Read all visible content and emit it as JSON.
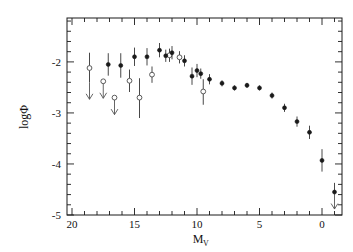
{
  "figure": {
    "background_color": "#ffffff",
    "axis_color": "#1a1a1a",
    "marker_filled_color": "#1a1a1a",
    "marker_open_color": "#ffffff",
    "arrow_color": "#555555"
  },
  "axes": {
    "x_label_main": "M",
    "x_label_sub": "V",
    "y_label": "logΦ",
    "x_ticklabels": [
      "20",
      "15",
      "10",
      "5",
      "0"
    ],
    "y_ticklabels": [
      "-2",
      "-3",
      "-4",
      "-5"
    ]
  },
  "chart_data": {
    "type": "scatter",
    "title": "",
    "xlabel": "M_V",
    "ylabel": "logΦ",
    "xlim": [
      20.4,
      -1.6
    ],
    "ylim": [
      -5.0,
      -1.14
    ],
    "x_major_ticks": [
      20,
      15,
      10,
      5,
      0
    ],
    "x_minor_tick_step": 1,
    "y_major_ticks": [
      -2,
      -3,
      -4,
      -5
    ],
    "y_minor_tick_step": 0.2,
    "grid": false,
    "legend": null,
    "x_axis_inverted": true,
    "series": [
      {
        "name": "Open symbols (upper limits and uncertain bins)",
        "marker": "open-circle",
        "points": [
          {
            "x": 18.6,
            "y": -2.12,
            "yerr_low": 0.28,
            "yerr_high": 0.3,
            "upper_limit": true
          },
          {
            "x": 17.5,
            "y": -2.38,
            "yerr_low": 0.0,
            "yerr_high": 0.0,
            "upper_limit": true
          },
          {
            "x": 16.6,
            "y": -2.7,
            "yerr_low": 0.0,
            "yerr_high": 0.0,
            "upper_limit": true
          },
          {
            "x": 14.6,
            "y": -2.7,
            "yerr_low": 0.4,
            "yerr_high": 0.38,
            "upper_limit": false
          },
          {
            "x": 15.4,
            "y": -2.37,
            "yerr_low": 0.22,
            "yerr_high": 0.22,
            "upper_limit": false
          },
          {
            "x": 13.6,
            "y": -2.25,
            "yerr_low": 0.16,
            "yerr_high": 0.16,
            "upper_limit": false
          },
          {
            "x": 12.2,
            "y": -1.87,
            "yerr_low": 0.13,
            "yerr_high": 0.13,
            "upper_limit": false
          },
          {
            "x": 11.4,
            "y": -1.91,
            "yerr_low": 0.12,
            "yerr_high": 0.12,
            "upper_limit": false
          },
          {
            "x": 9.5,
            "y": -2.58,
            "yerr_low": 0.26,
            "yerr_high": 0.24,
            "upper_limit": false
          }
        ]
      },
      {
        "name": "Filled symbols (measured luminosity function)",
        "marker": "filled-circle",
        "points": [
          {
            "x": 17.1,
            "y": -2.05,
            "yerr_low": 0.22,
            "yerr_high": 0.22,
            "upper_limit": false
          },
          {
            "x": 16.1,
            "y": -2.07,
            "yerr_low": 0.24,
            "yerr_high": 0.24,
            "upper_limit": false
          },
          {
            "x": 15.0,
            "y": -1.9,
            "yerr_low": 0.18,
            "yerr_high": 0.18,
            "upper_limit": false
          },
          {
            "x": 14.0,
            "y": -1.9,
            "yerr_low": 0.17,
            "yerr_high": 0.17,
            "upper_limit": false
          },
          {
            "x": 13.0,
            "y": -1.77,
            "yerr_low": 0.14,
            "yerr_high": 0.14,
            "upper_limit": false
          },
          {
            "x": 12.5,
            "y": -1.88,
            "yerr_low": 0.12,
            "yerr_high": 0.12,
            "upper_limit": false
          },
          {
            "x": 12.0,
            "y": -1.82,
            "yerr_low": 0.13,
            "yerr_high": 0.13,
            "upper_limit": false
          },
          {
            "x": 11.0,
            "y": -1.98,
            "yerr_low": 0.11,
            "yerr_high": 0.11,
            "upper_limit": false
          },
          {
            "x": 10.4,
            "y": -2.28,
            "yerr_low": 0.17,
            "yerr_high": 0.17,
            "upper_limit": false
          },
          {
            "x": 10.0,
            "y": -2.17,
            "yerr_low": 0.13,
            "yerr_high": 0.13,
            "upper_limit": false
          },
          {
            "x": 9.7,
            "y": -2.23,
            "yerr_low": 0.1,
            "yerr_high": 0.1,
            "upper_limit": false
          },
          {
            "x": 9.0,
            "y": -2.34,
            "yerr_low": 0.1,
            "yerr_high": 0.1,
            "upper_limit": false
          },
          {
            "x": 8.0,
            "y": -2.42,
            "yerr_low": 0.06,
            "yerr_high": 0.06,
            "upper_limit": false
          },
          {
            "x": 7.0,
            "y": -2.51,
            "yerr_low": 0.05,
            "yerr_high": 0.05,
            "upper_limit": false
          },
          {
            "x": 6.0,
            "y": -2.46,
            "yerr_low": 0.05,
            "yerr_high": 0.05,
            "upper_limit": false
          },
          {
            "x": 5.0,
            "y": -2.51,
            "yerr_low": 0.05,
            "yerr_high": 0.05,
            "upper_limit": false
          },
          {
            "x": 4.0,
            "y": -2.66,
            "yerr_low": 0.06,
            "yerr_high": 0.06,
            "upper_limit": false
          },
          {
            "x": 3.0,
            "y": -2.9,
            "yerr_low": 0.08,
            "yerr_high": 0.08,
            "upper_limit": false
          },
          {
            "x": 2.0,
            "y": -3.17,
            "yerr_low": 0.1,
            "yerr_high": 0.1,
            "upper_limit": false
          },
          {
            "x": 1.0,
            "y": -3.38,
            "yerr_low": 0.13,
            "yerr_high": 0.13,
            "upper_limit": false
          },
          {
            "x": 0.0,
            "y": -3.93,
            "yerr_low": 0.22,
            "yerr_high": 0.22,
            "upper_limit": false
          },
          {
            "x": -1.0,
            "y": -4.55,
            "yerr_low": 0.0,
            "yerr_high": 0.18,
            "upper_limit": true
          }
        ]
      }
    ]
  }
}
